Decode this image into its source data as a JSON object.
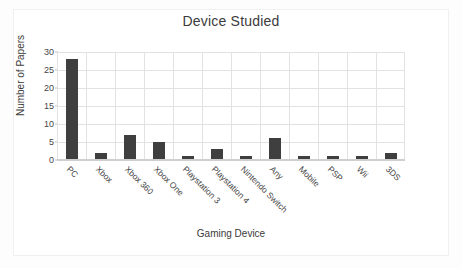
{
  "chart_data": {
    "type": "bar",
    "title": "Device Studied",
    "xlabel": "Gaming Device",
    "ylabel": "Number of Papers",
    "categories": [
      "PC",
      "Xbox",
      "Xbox 360",
      "Xbox One",
      "Playstation 3",
      "Playstation 4",
      "Nintendo Switch",
      "Any",
      "Mobile",
      "PSP",
      "Wii",
      "3DS"
    ],
    "values": [
      28,
      2,
      7,
      5,
      1,
      3,
      1,
      6,
      1,
      1,
      1,
      2
    ],
    "ylim": [
      0,
      30
    ],
    "yticks": [
      0,
      5,
      10,
      15,
      20,
      25,
      30
    ],
    "ytick_labels": [
      "0",
      "5",
      "10",
      "15",
      "20",
      "25",
      "30"
    ],
    "grid": true,
    "legend": false,
    "bar_color": "#3f3f3f",
    "gridline_color": "#e2e2e2",
    "plot_background": "#ffffff"
  }
}
